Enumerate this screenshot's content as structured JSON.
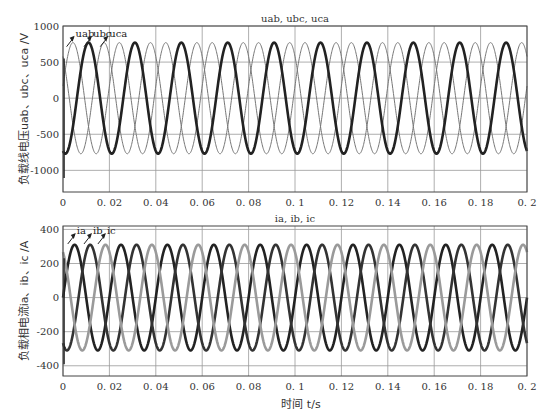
{
  "chart_data": [
    {
      "type": "line",
      "title": "uab, ubc, uca",
      "xlabel": "",
      "ylabel": "负载线电压uab、ubc、uca /V",
      "xlim": [
        0,
        0.2
      ],
      "ylim": [
        -1300,
        1000
      ],
      "xticks": [
        0,
        0.02,
        0.04,
        0.06,
        0.08,
        0.1,
        0.12,
        0.14,
        0.16,
        0.18,
        0.2
      ],
      "xtick_labels": [
        "0",
        "0.02",
        "0.04",
        "0.06",
        "0.08",
        "0.1",
        "0.12",
        "0.14",
        "0.16",
        "0.18",
        "0.2"
      ],
      "yticks": [
        -1000,
        -500,
        0,
        500,
        1000
      ],
      "ytick_labels": [
        "-1000",
        "-500",
        "0",
        "500",
        "1000"
      ],
      "grid": true,
      "frequency_hz": 50,
      "series": [
        {
          "name": "uab",
          "amplitude": 770,
          "peak_time": 0.011,
          "style": "thick-dark",
          "color": "#222222"
        },
        {
          "name": "ubc",
          "amplitude": 770,
          "peak_time": 0.0177,
          "style": "thin-gray",
          "color": "#777777"
        },
        {
          "name": "uca",
          "amplitude": 770,
          "peak_time": 0.0043,
          "style": "thin-gray",
          "color": "#777777"
        }
      ],
      "annotations": [
        {
          "text": "uab",
          "x": 0.005,
          "y": 880
        },
        {
          "text": "ubc",
          "x": 0.0125,
          "y": 880
        },
        {
          "text": "uca",
          "x": 0.0195,
          "y": 880
        }
      ]
    },
    {
      "type": "line",
      "title": "ia, ib, ic",
      "xlabel": "时间 t/s",
      "ylabel": "负载相电流ia、ib、ic /A",
      "xlim": [
        0,
        0.2
      ],
      "ylim": [
        -460,
        420
      ],
      "xticks": [
        0,
        0.02,
        0.04,
        0.06,
        0.08,
        0.1,
        0.12,
        0.14,
        0.16,
        0.18,
        0.2
      ],
      "xtick_labels": [
        "0",
        "0.02",
        "0.04",
        "0.06",
        "0.08",
        "0.1",
        "0.12",
        "0.14",
        "0.16",
        "0.18",
        "0.2"
      ],
      "yticks": [
        -400,
        -200,
        0,
        200,
        400
      ],
      "ytick_labels": [
        "-400",
        "-200",
        "0",
        "200",
        "400"
      ],
      "grid": true,
      "frequency_hz": 50,
      "series": [
        {
          "name": "ia",
          "amplitude": 310,
          "peak_time": 0.005,
          "style": "thick-dark",
          "color": "#222222"
        },
        {
          "name": "ib",
          "amplitude": 310,
          "peak_time": 0.0117,
          "style": "thick-dark",
          "color": "#333333"
        },
        {
          "name": "ic",
          "amplitude": 310,
          "peak_time": 0.0183,
          "style": "thick-gray",
          "color": "#9a9a9a"
        }
      ],
      "annotations": [
        {
          "text": "ia",
          "x": 0.0055,
          "y": 385
        },
        {
          "text": "ib",
          "x": 0.0125,
          "y": 385
        },
        {
          "text": "ic",
          "x": 0.0185,
          "y": 385
        }
      ]
    }
  ]
}
